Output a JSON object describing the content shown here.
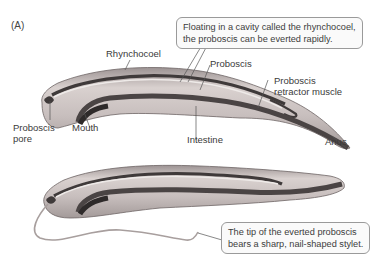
{
  "figure": {
    "panel_label": "(A)",
    "colors": {
      "body": "#c9c1c0",
      "body_light": "#e4dedc",
      "body_dark": "#8f8787",
      "intestine": "#4a4444",
      "proboscis": "#e9e4e2",
      "outline": "#6a6262",
      "leader": "#555555",
      "callout_border": "#9a9a9a"
    },
    "labels": {
      "rhynchocoel": "Rhynchocoel",
      "proboscis": "Proboscis",
      "retractor_line1": "Proboscis",
      "retractor_line2": "retractor muscle",
      "proboscis_pore_line1": "Proboscis",
      "proboscis_pore_line2": "pore",
      "mouth": "Mouth",
      "intestine": "Intestine",
      "anus": "Anus"
    },
    "callouts": {
      "top_line1": "Floating in a cavity called the rhynchocoel,",
      "top_line2": "the proboscis can be everted rapidly.",
      "bottom_line1": "The tip of the everted proboscis",
      "bottom_line2": "bears a sharp, nail-shaped stylet."
    }
  }
}
